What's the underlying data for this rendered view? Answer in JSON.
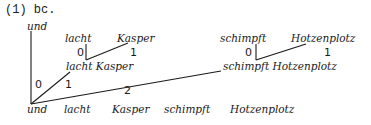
{
  "heading": "(1) bc.",
  "tree": {
    "root_top": "und",
    "left_branch": {
      "words": [
        "lacht",
        "Kasper"
      ],
      "index_0": "0",
      "index_1": "1",
      "combined": "lacht Kasper"
    },
    "right_branch": {
      "words": [
        "schimpft",
        "Hotzenplotz"
      ],
      "index_0": "0",
      "index_1": "1",
      "combined": "schimpft Hotzenplotz"
    },
    "root_indices": [
      "0",
      "1",
      "2"
    ],
    "bottom_row": [
      "und",
      "lacht",
      "Kasper",
      "schimpft",
      "Hotzenplotz"
    ]
  }
}
